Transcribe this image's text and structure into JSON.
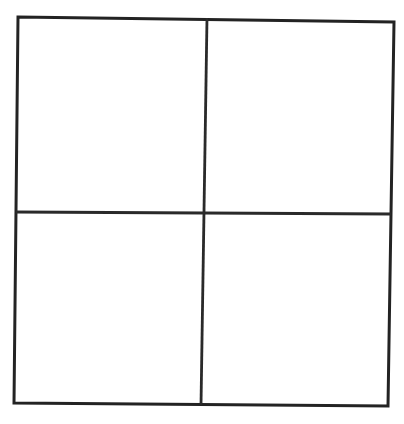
{
  "document": {
    "title": "2x2 Grid",
    "description": "A hand-drawn square divided into four equal quadrants by one vertical and one horizontal line.",
    "canvas": {
      "width": 404,
      "height": 424,
      "background_color": "#ffffff"
    }
  },
  "style": {
    "stroke_color": "#232323",
    "divider_color": "#2a2a2a",
    "stroke_width": 3,
    "divider_width": 2.8,
    "fill_color": "#ffffff"
  },
  "chart_data": {
    "type": "diagram",
    "title": "",
    "shape": "grid",
    "rows": 2,
    "columns": 2,
    "cell_count": 4,
    "grid": {
      "outline": {
        "name": "outer-square",
        "points": [
          {
            "x": 18,
            "y": 17
          },
          {
            "x": 394,
            "y": 22
          },
          {
            "x": 388,
            "y": 406
          },
          {
            "x": 14,
            "y": 403
          }
        ],
        "closed": true
      },
      "dividers": [
        {
          "name": "vertical-divider",
          "orientation": "vertical",
          "from": {
            "x": 207,
            "y": 18
          },
          "to": {
            "x": 201,
            "y": 405
          }
        },
        {
          "name": "horizontal-divider",
          "orientation": "horizontal",
          "from": {
            "x": 16,
            "y": 212
          },
          "to": {
            "x": 391,
            "y": 214
          }
        }
      ]
    },
    "cells": [
      {
        "id": "cell-top-left",
        "row": 0,
        "column": 0,
        "label": "",
        "fill": "#ffffff",
        "bounds": {
          "x": 18,
          "y": 17,
          "width": 189,
          "height": 196
        }
      },
      {
        "id": "cell-top-right",
        "row": 0,
        "column": 1,
        "label": "",
        "fill": "#ffffff",
        "bounds": {
          "x": 207,
          "y": 18,
          "width": 186,
          "height": 195
        }
      },
      {
        "id": "cell-bottom-left",
        "row": 1,
        "column": 0,
        "label": "",
        "fill": "#ffffff",
        "bounds": {
          "x": 16,
          "y": 213,
          "width": 188,
          "height": 191
        }
      },
      {
        "id": "cell-bottom-right",
        "row": 1,
        "column": 1,
        "label": "",
        "fill": "#ffffff",
        "bounds": {
          "x": 204,
          "y": 213,
          "width": 187,
          "height": 192
        }
      }
    ],
    "annotations": [],
    "legend": [],
    "grid_visible": true
  }
}
